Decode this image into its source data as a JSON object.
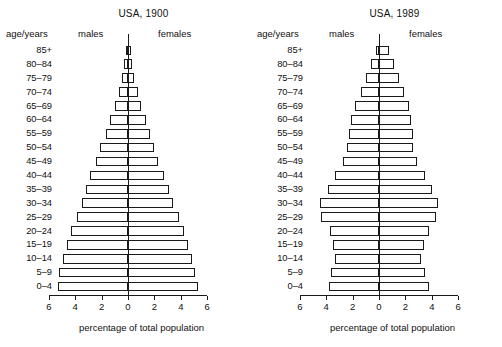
{
  "figure": {
    "axis_caption": "percentage of total population",
    "header_age": "age/years",
    "header_males": "males",
    "header_females": "females",
    "tick_labels": [
      "6",
      "4",
      "2",
      "0",
      "2",
      "4",
      "6"
    ],
    "age_groups": [
      "85+",
      "80–84",
      "75–79",
      "70–74",
      "65–69",
      "60–64",
      "55–59",
      "50–54",
      "45–49",
      "40–44",
      "35–39",
      "30–34",
      "25–29",
      "20–24",
      "15–19",
      "10–14",
      "5–9",
      "0–4"
    ],
    "line_color": "#1a1a1a",
    "bar_fill": "#ffffff",
    "background": "#ffffff"
  },
  "chart_data": [
    {
      "type": "bar",
      "title": "USA, 1900",
      "subtype": "population-pyramid",
      "xlabel": "percentage of total population",
      "ylabel": "age/years",
      "xlim": [
        -6,
        6
      ],
      "xticks": [
        -6,
        -4,
        -2,
        0,
        2,
        4,
        6
      ],
      "xticklabels": [
        "6",
        "4",
        "2",
        "0",
        "2",
        "4",
        "6"
      ],
      "grid": false,
      "legend": [
        "males",
        "females"
      ],
      "legend_position": "top-inside",
      "categories": [
        "85+",
        "80–84",
        "75–79",
        "70–74",
        "65–69",
        "60–64",
        "55–59",
        "50–54",
        "45–49",
        "40–44",
        "35–39",
        "30–34",
        "25–29",
        "20–24",
        "15–19",
        "10–14",
        "5–9",
        "0–4"
      ],
      "series": [
        {
          "name": "males",
          "side": "left",
          "values": [
            0.15,
            0.3,
            0.45,
            0.7,
            1.0,
            1.4,
            1.7,
            2.1,
            2.4,
            2.9,
            3.2,
            3.5,
            3.9,
            4.3,
            4.6,
            4.9,
            5.2,
            5.3
          ]
        },
        {
          "name": "females",
          "side": "right",
          "values": [
            0.2,
            0.32,
            0.48,
            0.72,
            1.0,
            1.35,
            1.65,
            2.0,
            2.3,
            2.7,
            3.1,
            3.4,
            3.85,
            4.25,
            4.55,
            4.85,
            5.1,
            5.3
          ]
        }
      ]
    },
    {
      "type": "bar",
      "title": "USA, 1989",
      "subtype": "population-pyramid",
      "xlabel": "percentage of total population",
      "ylabel": "age/years",
      "xlim": [
        -6,
        6
      ],
      "xticks": [
        -6,
        -4,
        -2,
        0,
        2,
        4,
        6
      ],
      "xticklabels": [
        "6",
        "4",
        "2",
        "0",
        "2",
        "4",
        "6"
      ],
      "grid": false,
      "legend": [
        "males",
        "females"
      ],
      "legend_position": "top-inside",
      "categories": [
        "85+",
        "80–84",
        "75–79",
        "70–74",
        "65–69",
        "60–64",
        "55–59",
        "50–54",
        "45–49",
        "40–44",
        "35–39",
        "30–34",
        "25–29",
        "20–24",
        "15–19",
        "10–14",
        "5–9",
        "0–4"
      ],
      "series": [
        {
          "name": "males",
          "side": "left",
          "values": [
            0.25,
            0.6,
            0.95,
            1.4,
            1.8,
            2.1,
            2.3,
            2.4,
            2.75,
            3.35,
            3.85,
            4.45,
            4.4,
            3.7,
            3.45,
            3.3,
            3.6,
            3.8
          ]
        },
        {
          "name": "females",
          "side": "right",
          "values": [
            0.75,
            1.15,
            1.5,
            1.9,
            2.25,
            2.45,
            2.6,
            2.6,
            2.9,
            3.45,
            4.0,
            4.45,
            4.3,
            3.75,
            3.4,
            3.2,
            3.5,
            3.75
          ]
        }
      ]
    }
  ]
}
